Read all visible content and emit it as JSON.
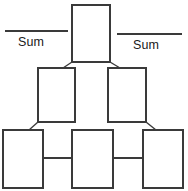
{
  "diagram": {
    "type": "sum-pyramid",
    "stroke_color": "#3a3a3a",
    "box_fill_color": "#ffffff",
    "text_color": "#1a1a1a",
    "labels": {
      "sum_left": "Sum",
      "sum_right": "Sum"
    },
    "rows": [
      {
        "name": "top-row",
        "boxes": [
          {
            "id": "box-top-1",
            "value": "",
            "x": 72,
            "y": 5,
            "width": 38,
            "height": 57
          }
        ]
      },
      {
        "name": "middle-row",
        "boxes": [
          {
            "id": "box-mid-1",
            "value": "",
            "x": 38,
            "y": 68,
            "width": 37,
            "height": 54
          },
          {
            "id": "box-mid-2",
            "value": "",
            "x": 108,
            "y": 68,
            "width": 38,
            "height": 54
          }
        ]
      },
      {
        "name": "bottom-row",
        "boxes": [
          {
            "id": "box-bot-1",
            "value": "",
            "x": 3,
            "y": 130,
            "width": 40,
            "height": 58
          },
          {
            "id": "box-bot-2",
            "value": "",
            "x": 72,
            "y": 130,
            "width": 41,
            "height": 58
          },
          {
            "id": "box-bot-3",
            "value": "",
            "x": 143,
            "y": 130,
            "width": 40,
            "height": 58
          }
        ]
      }
    ],
    "answer_lines": [
      {
        "id": "answer-line-left",
        "x1": 5,
        "y1": 31,
        "x2": 68,
        "y2": 31
      },
      {
        "id": "answer-line-right",
        "x1": 117,
        "y1": 34,
        "x2": 182,
        "y2": 34
      }
    ],
    "connectors": [
      {
        "id": "connector-top-to-mid-left",
        "kind": "diagonal",
        "x1": 72,
        "y1": 62,
        "x2": 63,
        "y2": 68
      },
      {
        "id": "connector-top-to-mid-right",
        "kind": "diagonal",
        "x1": 110,
        "y1": 62,
        "x2": 120,
        "y2": 68
      },
      {
        "id": "connector-mid-left-to-bot-left",
        "kind": "diagonal",
        "x1": 38,
        "y1": 122,
        "x2": 29,
        "y2": 130
      },
      {
        "id": "connector-mid-right-to-bot-right",
        "kind": "diagonal",
        "x1": 146,
        "y1": 122,
        "x2": 156,
        "y2": 130
      },
      {
        "id": "connector-bot-left-to-bot-mid",
        "kind": "horizontal",
        "x1": 43,
        "y1": 158,
        "x2": 72,
        "y2": 158
      },
      {
        "id": "connector-bot-mid-to-bot-right",
        "kind": "horizontal",
        "x1": 113,
        "y1": 158,
        "x2": 143,
        "y2": 158
      }
    ]
  }
}
